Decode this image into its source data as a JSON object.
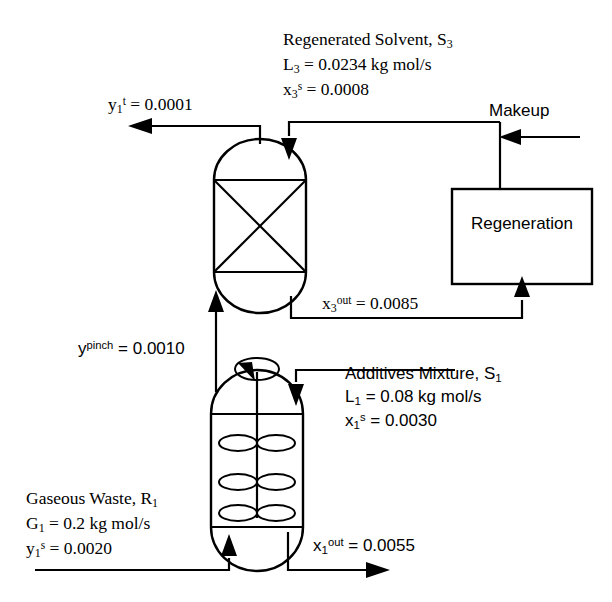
{
  "diagram": {
    "units": {
      "regeneration_box": "Regeneration"
    },
    "streams": {
      "regenerated_solvent": {
        "name": "Regenerated Solvent, S",
        "name_sub": "3",
        "flow_symbol": "L",
        "flow_sub": "3",
        "flow_value": "= 0.0234 kg mol/s",
        "comp_symbol": "x",
        "comp_sub": "3",
        "comp_sup": "s",
        "comp_value": "= 0.0008"
      },
      "treated_gas": {
        "symbol": "y",
        "sub": "1",
        "sup": "t",
        "value": "= 0.0001"
      },
      "makeup": {
        "label": "Makeup"
      },
      "spent_solvent": {
        "symbol": "x",
        "sub": "3",
        "sup": "out",
        "value": "= 0.0085"
      },
      "pinch_gas": {
        "symbol": "y",
        "sup": "pinch",
        "value": "= 0.0010"
      },
      "additives_mixture": {
        "name": "Additives Mixture, S",
        "name_sub": "1",
        "flow_symbol": "L",
        "flow_sub": "1",
        "flow_value": "= 0.08 kg mol/s",
        "comp_symbol": "x",
        "comp_sub": "1",
        "comp_sup": "s",
        "comp_value": "= 0.0030"
      },
      "gaseous_waste": {
        "name": "Gaseous Waste, R",
        "name_sub": "1",
        "flow_symbol": "G",
        "flow_sub": "1",
        "flow_value": "= 0.2 kg mol/s",
        "comp_symbol": "y",
        "comp_sub": "1",
        "comp_sup": "s",
        "comp_value": "= 0.0020"
      },
      "liquid_outlet": {
        "symbol": "x",
        "sub": "1",
        "sup": "out",
        "value": "= 0.0055"
      }
    },
    "colors": {
      "line": "#000000",
      "background": "#ffffff",
      "text": "#000000"
    }
  }
}
